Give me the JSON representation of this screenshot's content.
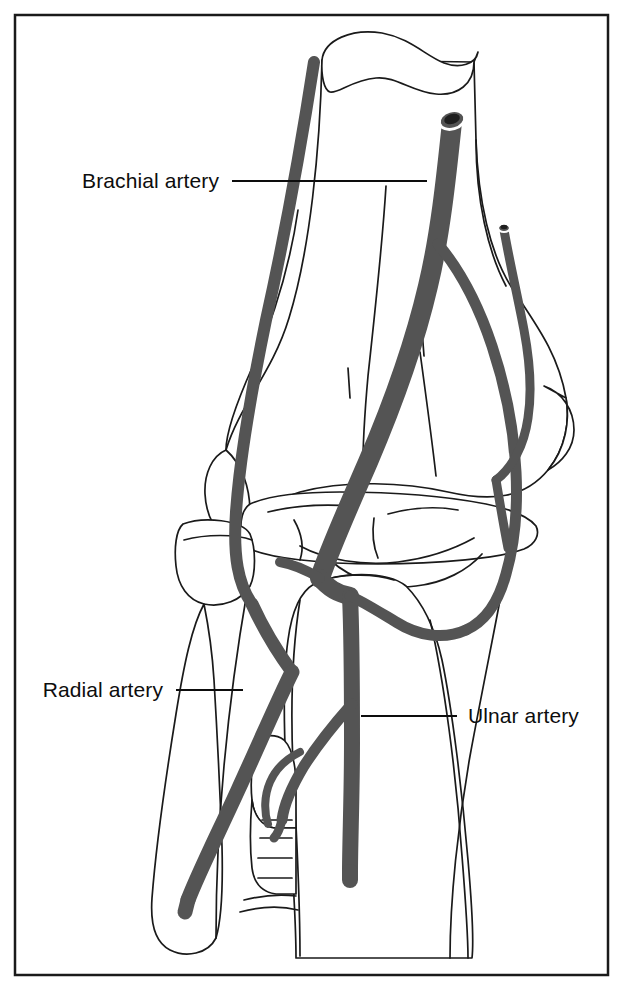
{
  "figure": {
    "view": "anterior-view-right-elbow",
    "background_color": "#ffffff",
    "border": {
      "name": "figure-border",
      "color": "#1a1a1a",
      "x": 15,
      "y": 15,
      "width": 593,
      "height": 960,
      "stroke_width": 2.5
    },
    "colors": {
      "artery_fill": "#545454",
      "artery_outline": "#3c3c3c",
      "bone_outline": "#1a1a1a",
      "bone_fill": "#ffffff",
      "label_text": "#0d0d0d",
      "leader_line": "#0d0d0d"
    }
  },
  "labels": [
    {
      "id": "brachial-artery",
      "text": "Brachial artery",
      "text_anchor": "end",
      "text_x": 219,
      "text_y": 188,
      "leader": {
        "x1": 232,
        "y1": 181,
        "x2": 427,
        "y2": 181
      }
    },
    {
      "id": "radial-artery",
      "text": "Radial artery",
      "text_anchor": "end",
      "text_x": 163,
      "text_y": 697,
      "leader": {
        "x1": 176,
        "y1": 690,
        "x2": 243,
        "y2": 690
      }
    },
    {
      "id": "ulnar-artery",
      "text": "Ulnar artery",
      "text_anchor": "start",
      "text_x": 468,
      "text_y": 723,
      "leader": {
        "x1": 361,
        "y1": 716,
        "x2": 457,
        "y2": 716
      }
    }
  ],
  "structures": {
    "bones": [
      {
        "id": "humerus-shaft",
        "label": "Humerus shaft (cut)"
      },
      {
        "id": "humerus-cut-surface",
        "label": "Humerus cut cross-section"
      },
      {
        "id": "medial-epicondyle",
        "label": "Medial epicondyle"
      },
      {
        "id": "lateral-epicondyle",
        "label": "Lateral epicondyle"
      },
      {
        "id": "trochlea",
        "label": "Trochlea"
      },
      {
        "id": "capitulum",
        "label": "Capitulum"
      },
      {
        "id": "radial-head",
        "label": "Radial head"
      },
      {
        "id": "radial-neck",
        "label": "Radial neck"
      },
      {
        "id": "radial-shaft",
        "label": "Radius shaft"
      },
      {
        "id": "ulna-shaft",
        "label": "Ulna shaft"
      },
      {
        "id": "coronoid-process",
        "label": "Coronoid process"
      },
      {
        "id": "interosseous-membrane",
        "label": "Interosseous membrane"
      }
    ],
    "vessels": [
      {
        "id": "brachial-artery-trunk",
        "label": "Brachial artery",
        "cut_end": true
      },
      {
        "id": "radial-artery-trunk",
        "label": "Radial artery",
        "cut_end": true
      },
      {
        "id": "ulnar-artery-trunk",
        "label": "Ulnar artery",
        "cut_end": true
      },
      {
        "id": "superior-ulnar-collateral",
        "label": "Superior ulnar collateral artery",
        "cut_end": true
      },
      {
        "id": "radial-collateral-artery",
        "label": "Radial collateral artery",
        "cut_end": true
      },
      {
        "id": "radial-recurrent-artery",
        "label": "Radial recurrent artery"
      },
      {
        "id": "ulnar-recurrent-artery",
        "label": "Ulnar recurrent artery"
      },
      {
        "id": "common-interosseous-artery",
        "label": "Common interosseous artery"
      },
      {
        "id": "inferior-ulnar-collateral",
        "label": "Inferior ulnar collateral artery"
      }
    ]
  }
}
